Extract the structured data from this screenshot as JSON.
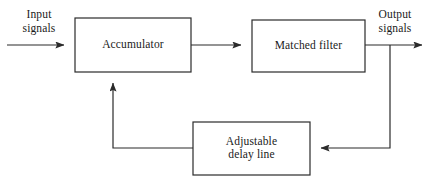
{
  "diagram": {
    "type": "block-diagram",
    "stroke_color": "#2b2b2b",
    "background_color": "#ffffff",
    "blocks": [
      {
        "id": "accumulator",
        "label": "Accumulator",
        "x": 75,
        "y": 18,
        "width": 116,
        "height": 54
      },
      {
        "id": "matched-filter",
        "label": "Matched filter",
        "x": 252,
        "y": 20,
        "width": 113,
        "height": 52
      },
      {
        "id": "adjustable-delay-line",
        "label": "Adjustable\ndelay line",
        "line1": "Adjustable",
        "line2": "delay line",
        "x": 193,
        "y": 122,
        "width": 117,
        "height": 53
      }
    ],
    "labels": [
      {
        "id": "input-signals",
        "text": "Input\nsignals",
        "line1": "Input",
        "line2": "signals"
      },
      {
        "id": "output-signals",
        "text": "Output\nsignals",
        "line1": "Output",
        "line2": "signals"
      }
    ],
    "connections": [
      {
        "id": "input-to-accumulator",
        "from": "input",
        "to": "accumulator",
        "arrow": true,
        "path": "M 7 45 L 73 45"
      },
      {
        "id": "accumulator-to-matched-filter",
        "from": "accumulator",
        "to": "matched-filter",
        "arrow": true,
        "path": "M 191 45 L 250 45"
      },
      {
        "id": "matched-filter-to-output",
        "from": "matched-filter",
        "to": "output",
        "arrow": true,
        "path": "M 365 45 L 431 45"
      },
      {
        "id": "output-tap-to-delay-line",
        "from": "output-junction",
        "to": "adjustable-delay-line",
        "arrow": true,
        "path": "M 390 45 L 390 148 L 312 148"
      },
      {
        "id": "delay-line-to-accumulator",
        "from": "adjustable-delay-line",
        "to": "accumulator",
        "arrow": true,
        "path": "M 193 148 L 113 148 L 113 74"
      }
    ]
  }
}
